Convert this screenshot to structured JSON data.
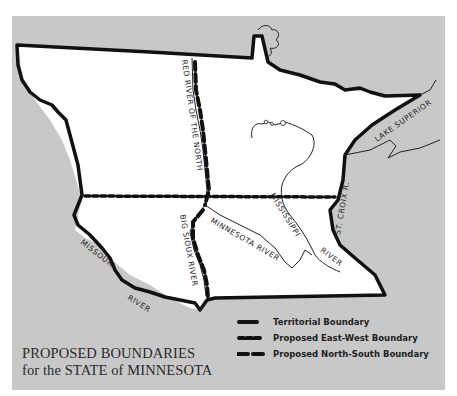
{
  "title": {
    "line1": "PROPOSED BOUNDARIES",
    "line2": "for the STATE of MINNESOTA"
  },
  "legend": {
    "items": [
      {
        "label": "Territorial Boundary",
        "style": "solid"
      },
      {
        "label": "Proposed East-West Boundary",
        "style": "dotted-dash"
      },
      {
        "label": "Proposed North-South Boundary",
        "style": "long-dash"
      }
    ]
  },
  "labels": {
    "red_river": "RED RIVER OF THE NORTH",
    "lake_superior": "LAKE SUPERIOR",
    "mississippi": "MISSISSIPPI",
    "st_croix": "ST. CROIX R.",
    "minnesota_river": "MINNESOTA RIVER",
    "big_sioux": "BIG SIOUX RIVER",
    "missouri": "MISSOURI",
    "missouri_river": "RIVER",
    "miss_river": "RIVER"
  },
  "colors": {
    "background": "#ffffff",
    "panel": "#c8c8c8",
    "territory": "#ffffff",
    "boundary": "#111111"
  }
}
